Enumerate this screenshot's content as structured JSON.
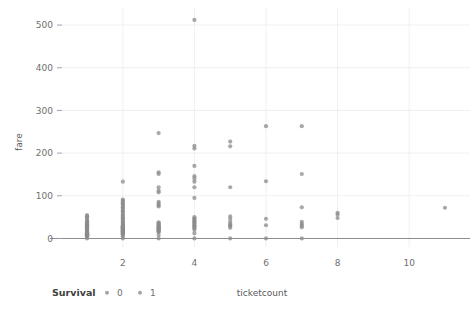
{
  "chart_data": {
    "type": "scatter",
    "title": "",
    "xlabel": "ticketcount",
    "ylabel": "fare",
    "xlim": [
      0.3,
      11.7
    ],
    "ylim": [
      -20,
      540
    ],
    "xticks": [
      2,
      4,
      6,
      8,
      10
    ],
    "yticks": [
      0,
      100,
      200,
      300,
      400,
      500
    ],
    "grid": true,
    "legend": {
      "title": "Survival",
      "position": "bottom-left",
      "entries": [
        {
          "label": "0",
          "color": "#8f8f8f"
        },
        {
          "label": "1",
          "color": "#8f8f8f"
        }
      ]
    },
    "point_color": "#8b8b8b",
    "point_radius": 2.1,
    "point_opacity": 0.75,
    "series": [
      {
        "name": "Survival",
        "points": [
          {
            "x": 1,
            "y": 0
          },
          {
            "x": 1,
            "y": 4
          },
          {
            "x": 1,
            "y": 6
          },
          {
            "x": 1,
            "y": 7
          },
          {
            "x": 1,
            "y": 7.2
          },
          {
            "x": 1,
            "y": 7.5
          },
          {
            "x": 1,
            "y": 7.8
          },
          {
            "x": 1,
            "y": 8
          },
          {
            "x": 1,
            "y": 8.5
          },
          {
            "x": 1,
            "y": 9
          },
          {
            "x": 1,
            "y": 10
          },
          {
            "x": 1,
            "y": 11
          },
          {
            "x": 1,
            "y": 12
          },
          {
            "x": 1,
            "y": 13
          },
          {
            "x": 1,
            "y": 14
          },
          {
            "x": 1,
            "y": 15
          },
          {
            "x": 1,
            "y": 16
          },
          {
            "x": 1,
            "y": 18
          },
          {
            "x": 1,
            "y": 20
          },
          {
            "x": 1,
            "y": 22
          },
          {
            "x": 1,
            "y": 24
          },
          {
            "x": 1,
            "y": 26
          },
          {
            "x": 1,
            "y": 27
          },
          {
            "x": 1,
            "y": 28
          },
          {
            "x": 1,
            "y": 30
          },
          {
            "x": 1,
            "y": 31
          },
          {
            "x": 1,
            "y": 33
          },
          {
            "x": 1,
            "y": 35
          },
          {
            "x": 1,
            "y": 38
          },
          {
            "x": 1,
            "y": 40
          },
          {
            "x": 1,
            "y": 42
          },
          {
            "x": 1,
            "y": 46
          },
          {
            "x": 1,
            "y": 50
          },
          {
            "x": 1,
            "y": 52
          },
          {
            "x": 1,
            "y": 55
          },
          {
            "x": 2,
            "y": 0
          },
          {
            "x": 2,
            "y": 5
          },
          {
            "x": 2,
            "y": 9
          },
          {
            "x": 2,
            "y": 10
          },
          {
            "x": 2,
            "y": 12
          },
          {
            "x": 2,
            "y": 13
          },
          {
            "x": 2,
            "y": 14
          },
          {
            "x": 2,
            "y": 15
          },
          {
            "x": 2,
            "y": 16
          },
          {
            "x": 2,
            "y": 17
          },
          {
            "x": 2,
            "y": 18
          },
          {
            "x": 2,
            "y": 19
          },
          {
            "x": 2,
            "y": 20
          },
          {
            "x": 2,
            "y": 21
          },
          {
            "x": 2,
            "y": 22
          },
          {
            "x": 2,
            "y": 23
          },
          {
            "x": 2,
            "y": 24
          },
          {
            "x": 2,
            "y": 25
          },
          {
            "x": 2,
            "y": 26
          },
          {
            "x": 2,
            "y": 26.5
          },
          {
            "x": 2,
            "y": 27
          },
          {
            "x": 2,
            "y": 28
          },
          {
            "x": 2,
            "y": 29
          },
          {
            "x": 2,
            "y": 30
          },
          {
            "x": 2,
            "y": 32
          },
          {
            "x": 2,
            "y": 34
          },
          {
            "x": 2,
            "y": 36
          },
          {
            "x": 2,
            "y": 39
          },
          {
            "x": 2,
            "y": 41
          },
          {
            "x": 2,
            "y": 44
          },
          {
            "x": 2,
            "y": 47
          },
          {
            "x": 2,
            "y": 50
          },
          {
            "x": 2,
            "y": 53
          },
          {
            "x": 2,
            "y": 56
          },
          {
            "x": 2,
            "y": 60
          },
          {
            "x": 2,
            "y": 63
          },
          {
            "x": 2,
            "y": 66
          },
          {
            "x": 2,
            "y": 70
          },
          {
            "x": 2,
            "y": 73
          },
          {
            "x": 2,
            "y": 76
          },
          {
            "x": 2,
            "y": 79
          },
          {
            "x": 2,
            "y": 82
          },
          {
            "x": 2,
            "y": 85
          },
          {
            "x": 2,
            "y": 89
          },
          {
            "x": 2,
            "y": 91
          },
          {
            "x": 2,
            "y": 133
          },
          {
            "x": 3,
            "y": 0
          },
          {
            "x": 3,
            "y": 8
          },
          {
            "x": 3,
            "y": 15
          },
          {
            "x": 3,
            "y": 16
          },
          {
            "x": 3,
            "y": 18
          },
          {
            "x": 3,
            "y": 20
          },
          {
            "x": 3,
            "y": 21
          },
          {
            "x": 3,
            "y": 22
          },
          {
            "x": 3,
            "y": 24
          },
          {
            "x": 3,
            "y": 25
          },
          {
            "x": 3,
            "y": 26
          },
          {
            "x": 3,
            "y": 28
          },
          {
            "x": 3,
            "y": 30
          },
          {
            "x": 3,
            "y": 32
          },
          {
            "x": 3,
            "y": 34
          },
          {
            "x": 3,
            "y": 36
          },
          {
            "x": 3,
            "y": 38
          },
          {
            "x": 3,
            "y": 75
          },
          {
            "x": 3,
            "y": 78
          },
          {
            "x": 3,
            "y": 82
          },
          {
            "x": 3,
            "y": 86
          },
          {
            "x": 3,
            "y": 108
          },
          {
            "x": 3,
            "y": 112
          },
          {
            "x": 3,
            "y": 120
          },
          {
            "x": 3,
            "y": 151
          },
          {
            "x": 3,
            "y": 155
          },
          {
            "x": 3,
            "y": 247
          },
          {
            "x": 4,
            "y": 0
          },
          {
            "x": 4,
            "y": 12
          },
          {
            "x": 4,
            "y": 20
          },
          {
            "x": 4,
            "y": 24
          },
          {
            "x": 4,
            "y": 27
          },
          {
            "x": 4,
            "y": 29
          },
          {
            "x": 4,
            "y": 31
          },
          {
            "x": 4,
            "y": 34
          },
          {
            "x": 4,
            "y": 37
          },
          {
            "x": 4,
            "y": 39
          },
          {
            "x": 4,
            "y": 41
          },
          {
            "x": 4,
            "y": 44
          },
          {
            "x": 4,
            "y": 47
          },
          {
            "x": 4,
            "y": 50
          },
          {
            "x": 4,
            "y": 95
          },
          {
            "x": 4,
            "y": 120
          },
          {
            "x": 4,
            "y": 133
          },
          {
            "x": 4,
            "y": 140
          },
          {
            "x": 4,
            "y": 146
          },
          {
            "x": 4,
            "y": 170
          },
          {
            "x": 4,
            "y": 211
          },
          {
            "x": 4,
            "y": 217
          },
          {
            "x": 4,
            "y": 512
          },
          {
            "x": 5,
            "y": 0
          },
          {
            "x": 5,
            "y": 25
          },
          {
            "x": 5,
            "y": 29
          },
          {
            "x": 5,
            "y": 31
          },
          {
            "x": 5,
            "y": 34
          },
          {
            "x": 5,
            "y": 39
          },
          {
            "x": 5,
            "y": 46
          },
          {
            "x": 5,
            "y": 52
          },
          {
            "x": 5,
            "y": 120
          },
          {
            "x": 5,
            "y": 216
          },
          {
            "x": 5,
            "y": 227
          },
          {
            "x": 6,
            "y": 0
          },
          {
            "x": 6,
            "y": 31
          },
          {
            "x": 6,
            "y": 46
          },
          {
            "x": 6,
            "y": 134
          },
          {
            "x": 6,
            "y": 263
          },
          {
            "x": 7,
            "y": 0
          },
          {
            "x": 7,
            "y": 26
          },
          {
            "x": 7,
            "y": 30
          },
          {
            "x": 7,
            "y": 34
          },
          {
            "x": 7,
            "y": 39
          },
          {
            "x": 7,
            "y": 73
          },
          {
            "x": 7,
            "y": 151
          },
          {
            "x": 7,
            "y": 263
          },
          {
            "x": 8,
            "y": 48
          },
          {
            "x": 8,
            "y": 56
          },
          {
            "x": 8,
            "y": 60
          },
          {
            "x": 11,
            "y": 72
          }
        ]
      }
    ]
  }
}
